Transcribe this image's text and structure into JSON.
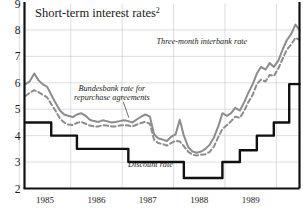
{
  "chart_data": {
    "type": "line",
    "title": "Short-term interest rates",
    "title_superscript": "2",
    "xlabel": "",
    "ylabel": "",
    "ylim": [
      2,
      9
    ],
    "xlim": [
      1984.6,
      1989.95
    ],
    "yticks": [
      "9",
      "8",
      "7",
      "6",
      "5",
      "4",
      "3",
      "2"
    ],
    "ytick_values": [
      9,
      8,
      7,
      6,
      5,
      4,
      3,
      2
    ],
    "xticks": [
      "1985",
      "1986",
      "1987",
      "1988",
      "1989"
    ],
    "xtick_values": [
      1985.0,
      1986.0,
      1987.0,
      1988.0,
      1989.0
    ],
    "grid": true,
    "grid_color": "#c8c8c8",
    "axis_color": "#111111",
    "background": "#ffffff",
    "legend_position": "inline-annotations",
    "series": [
      {
        "name": "Three-month interbank rate",
        "style": "solid",
        "color": "#8c8c8c",
        "width": 2.0,
        "label_position": {
          "x": 1988.05,
          "y": 7.45
        },
        "x": [
          1984.62,
          1984.7,
          1984.79,
          1984.87,
          1984.95,
          1985.04,
          1985.12,
          1985.2,
          1985.29,
          1985.37,
          1985.45,
          1985.54,
          1985.62,
          1985.7,
          1985.79,
          1985.87,
          1985.95,
          1986.04,
          1986.12,
          1986.2,
          1986.29,
          1986.37,
          1986.45,
          1986.54,
          1986.62,
          1986.7,
          1986.79,
          1986.87,
          1986.95,
          1987.04,
          1987.12,
          1987.2,
          1987.29,
          1987.37,
          1987.45,
          1987.54,
          1987.62,
          1987.7,
          1987.79,
          1987.87,
          1987.95,
          1988.04,
          1988.12,
          1988.2,
          1988.29,
          1988.37,
          1988.45,
          1988.54,
          1988.62,
          1988.7,
          1988.79,
          1988.87,
          1988.95,
          1989.04,
          1989.12,
          1989.2,
          1989.29,
          1989.37,
          1989.45,
          1989.54,
          1989.62,
          1989.7,
          1989.79,
          1989.87,
          1989.95
        ],
        "y": [
          5.95,
          6.05,
          6.35,
          6.1,
          5.95,
          5.85,
          5.55,
          5.25,
          4.95,
          4.8,
          4.75,
          4.7,
          4.8,
          4.85,
          4.75,
          4.6,
          4.55,
          4.52,
          4.58,
          4.55,
          4.5,
          4.52,
          4.55,
          4.58,
          4.55,
          4.5,
          4.62,
          4.72,
          4.8,
          4.72,
          4.05,
          3.9,
          3.85,
          3.8,
          3.95,
          4.05,
          4.6,
          4.0,
          3.55,
          3.4,
          3.35,
          3.4,
          3.5,
          3.65,
          3.95,
          4.35,
          4.85,
          4.75,
          4.85,
          5.05,
          4.95,
          5.25,
          5.6,
          5.95,
          6.35,
          6.6,
          6.5,
          6.75,
          6.6,
          6.85,
          7.25,
          7.6,
          7.85,
          8.2,
          8.0
        ]
      },
      {
        "name": "Bundesbank rate for repurchase agreements",
        "style": "dashed",
        "color": "#8c8c8c",
        "width": 2.0,
        "label_position": {
          "x": 1986.3,
          "y": 5.7
        },
        "x": [
          1984.62,
          1984.7,
          1984.79,
          1984.87,
          1984.95,
          1985.04,
          1985.12,
          1985.2,
          1985.29,
          1985.37,
          1985.45,
          1985.54,
          1985.62,
          1985.7,
          1985.79,
          1985.87,
          1985.95,
          1986.04,
          1986.12,
          1986.2,
          1986.29,
          1986.37,
          1986.45,
          1986.54,
          1986.62,
          1986.7,
          1986.79,
          1986.87,
          1986.95,
          1987.04,
          1987.12,
          1987.2,
          1987.29,
          1987.37,
          1987.45,
          1987.54,
          1987.62,
          1987.7,
          1987.79,
          1987.87,
          1987.95,
          1988.04,
          1988.12,
          1988.2,
          1988.29,
          1988.37,
          1988.45,
          1988.54,
          1988.62,
          1988.7,
          1988.79,
          1988.87,
          1988.95,
          1989.04,
          1989.12,
          1989.2,
          1989.29,
          1989.37,
          1989.45,
          1989.54,
          1989.62,
          1989.7,
          1989.79,
          1989.87,
          1989.95
        ],
        "y": [
          5.5,
          5.62,
          5.72,
          5.65,
          5.55,
          5.45,
          5.2,
          4.95,
          4.65,
          4.5,
          4.42,
          4.4,
          4.48,
          4.52,
          4.45,
          4.38,
          4.35,
          4.35,
          4.4,
          4.38,
          4.35,
          4.35,
          4.38,
          4.4,
          4.38,
          4.35,
          4.42,
          4.48,
          4.52,
          4.45,
          3.85,
          3.72,
          3.68,
          3.62,
          3.72,
          3.8,
          3.78,
          3.6,
          3.38,
          3.28,
          3.25,
          3.28,
          3.3,
          3.38,
          3.6,
          3.95,
          4.25,
          4.4,
          4.55,
          4.72,
          4.68,
          4.92,
          5.25,
          5.55,
          5.95,
          6.12,
          6.05,
          6.3,
          6.25,
          6.55,
          6.9,
          7.25,
          7.45,
          7.7,
          7.62
        ]
      },
      {
        "name": "Discount rate",
        "style": "step",
        "color": "#111111",
        "width": 2.4,
        "label_position": {
          "x": 1987.05,
          "y": 2.82
        },
        "x": [
          1984.62,
          1985.12,
          1985.12,
          1985.62,
          1985.62,
          1986.62,
          1986.62,
          1987.7,
          1987.7,
          1988.45,
          1988.45,
          1988.79,
          1988.79,
          1989.12,
          1989.12,
          1989.45,
          1989.45,
          1989.75,
          1989.75,
          1989.95
        ],
        "y": [
          4.5,
          4.5,
          4.0,
          4.0,
          3.5,
          3.5,
          3.0,
          3.0,
          2.4,
          2.4,
          3.0,
          3.0,
          3.45,
          3.45,
          4.0,
          4.0,
          4.5,
          4.5,
          5.95,
          5.95
        ]
      }
    ],
    "annotations": [
      {
        "text": "Three-month interbank rate",
        "name": "interbank-label"
      },
      {
        "text": "Bundesbank rate for",
        "name": "repo-label-line1"
      },
      {
        "text": "repurchase agreements",
        "name": "repo-label-line2"
      },
      {
        "text": "Discount rate",
        "name": "discount-label"
      }
    ]
  }
}
